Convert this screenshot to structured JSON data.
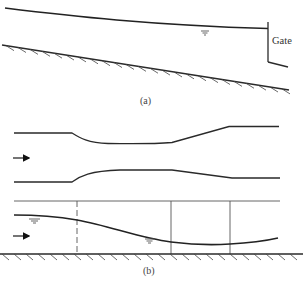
{
  "figure": {
    "panel_a": {
      "caption": "(a)",
      "gate_label": "Gate",
      "elements": [
        "water-surface-profile",
        "sloping-channel-bed",
        "sluice-gate",
        "free-surface-symbol"
      ]
    },
    "panel_b": {
      "caption": "(b)",
      "plan_view": {
        "elements": [
          "upper-wall",
          "lower-wall",
          "flow-arrow"
        ],
        "description": "channel contraction then expansion"
      },
      "profile_view": {
        "elements": [
          "water-surface-profile",
          "horizontal-bed",
          "section-lines",
          "flow-arrow",
          "free-surface-symbols"
        ]
      }
    },
    "colors": {
      "line": "#2a2a2a",
      "background": "#ffffff"
    }
  }
}
